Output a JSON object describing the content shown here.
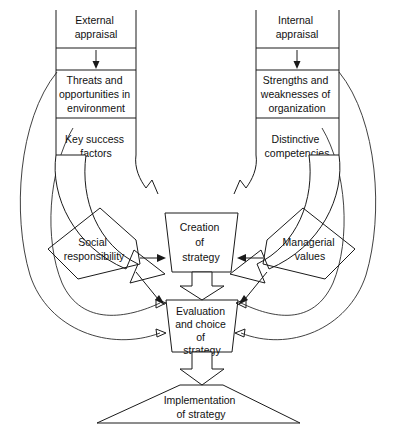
{
  "diagram": {
    "colors": {
      "stroke": "#1a1a1a",
      "text": "#111111",
      "background": "#ffffff"
    },
    "nodes": {
      "external_appraisal": {
        "line1": "External",
        "line2": "appraisal"
      },
      "internal_appraisal": {
        "line1": "Internal",
        "line2": "appraisal"
      },
      "threats": {
        "line1": "Threats and",
        "line2": "opportunities in",
        "line3": "environment"
      },
      "strengths": {
        "line1": "Strengths and",
        "line2": "weaknesses of",
        "line3": "organization"
      },
      "key_success": {
        "line1": "Key success",
        "line2": "factors"
      },
      "distinctive": {
        "line1": "Distinctive",
        "line2": "competencies"
      },
      "social_responsibility": {
        "line1": "Social",
        "line2": "responsibility"
      },
      "managerial_values": {
        "line1": "Managerial",
        "line2": "values"
      },
      "creation": {
        "line1": "Creation",
        "line2": "of",
        "line3": "strategy"
      },
      "evaluation": {
        "line1": "Evaluation",
        "line2": "and choice",
        "line3": "of",
        "line4": "strategy"
      },
      "implementation": {
        "line1": "Implementation",
        "line2": "of strategy"
      }
    }
  }
}
